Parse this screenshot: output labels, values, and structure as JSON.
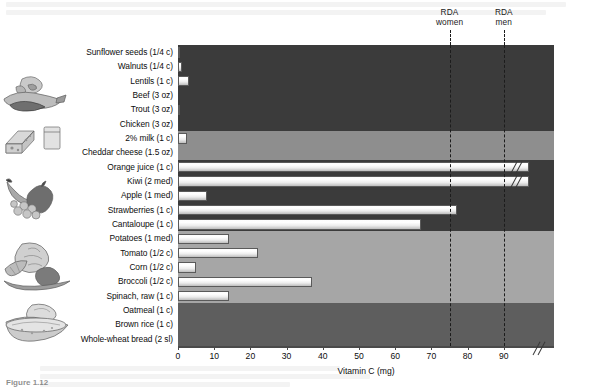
{
  "figure": {
    "caption": "Figure 1.12"
  },
  "chart_data": {
    "type": "bar",
    "orientation": "horizontal",
    "title": "",
    "xlabel": "Vitamin C (mg)",
    "ylabel": "",
    "xlim": [
      0,
      100
    ],
    "xticks": [
      0,
      10,
      20,
      30,
      40,
      50,
      60,
      70,
      80,
      90
    ],
    "xtick_labels": [
      "0",
      "10",
      "20",
      "30",
      "40",
      "50",
      "60",
      "70",
      "80",
      "90"
    ],
    "axis_break_at": 95,
    "grid": false,
    "legend": "none",
    "categories": [
      "Sunflower seeds (1/4 c)",
      "Walnuts (1/4 c)",
      "Lentils (1 c)",
      "Beef (3 oz)",
      "Trout (3 oz)",
      "Chicken (3 oz)",
      "2% milk (1 c)",
      "Cheddar cheese (1.5 oz)",
      "Orange juice (1 c)",
      "Kiwi (2 med)",
      "Apple (1 med)",
      "Strawberries (1 c)",
      "Cantaloupe (1 c)",
      "Potatoes (1 med)",
      "Tomato (1/2 c)",
      "Corn (1/2 c)",
      "Broccoli (1/2 c)",
      "Spinach, raw (1 c)",
      "Oatmeal (1 c)",
      "Brown rice (1 c)",
      "Whole-wheat bread (2 sl)"
    ],
    "values": [
      0.5,
      1.0,
      3.0,
      0.0,
      0.5,
      0.0,
      2.5,
      0.0,
      97,
      97,
      8,
      77,
      67,
      14,
      22,
      5,
      37,
      14,
      0,
      0,
      0
    ],
    "truncated": [
      false,
      false,
      false,
      false,
      false,
      false,
      false,
      false,
      true,
      true,
      false,
      false,
      false,
      false,
      false,
      false,
      false,
      false,
      false,
      false,
      false
    ],
    "annotations": [
      {
        "label_line1": "RDA",
        "label_line2": "women",
        "value": 75
      },
      {
        "label_line1": "RDA",
        "label_line2": "men",
        "value": 90
      }
    ],
    "groups": [
      {
        "name": "protein-foods",
        "start": 0,
        "end": 5,
        "shade": "#3b3b3b",
        "icon": "meat-fish-nuts-icon"
      },
      {
        "name": "dairy",
        "start": 6,
        "end": 7,
        "shade": "#8e8e8e",
        "icon": "dairy-icon"
      },
      {
        "name": "fruits",
        "start": 8,
        "end": 12,
        "shade": "#3b3b3b",
        "icon": "fruit-icon"
      },
      {
        "name": "vegetables",
        "start": 13,
        "end": 17,
        "shade": "#a6a6a6",
        "icon": "vegetable-icon"
      },
      {
        "name": "grains",
        "start": 18,
        "end": 20,
        "shade": "#5e5e5e",
        "icon": "grains-bread-icon"
      }
    ],
    "colors": {
      "bar_fill": "#f4f4f4",
      "bar_edge": "#5a5a5a",
      "axis": "#4a4a4a",
      "rda_line": "#1c1c1c"
    }
  }
}
